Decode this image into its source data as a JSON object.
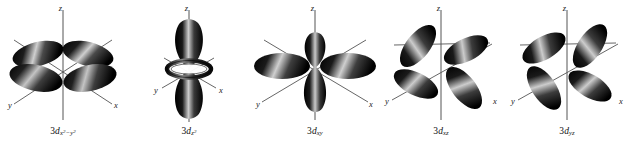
{
  "figure": {
    "background_color": "#ffffff",
    "lobe_color_dark": "#0b0b0b",
    "lobe_color_highlight": "#d8d8d8",
    "axis_color": "#555555",
    "text_color": "#111111"
  },
  "axis_labels": {
    "x": "x",
    "y": "y",
    "z": "z"
  },
  "orbitals": [
    {
      "id": "3d-x2-y2",
      "prefix": "3",
      "symbol": "d",
      "subscript_plain": "x2-y2",
      "caption_text": "3dx²−y²",
      "sub_first_var": "x",
      "sub_first_exp": "2",
      "sub_minus": "−",
      "sub_second_var": "y",
      "sub_second_exp": "2",
      "lobe_count": 4,
      "has_torus": false,
      "description": "four lobes along x and y axes"
    },
    {
      "id": "3d-z2",
      "prefix": "3",
      "symbol": "d",
      "subscript_plain": "z2",
      "caption_text": "3dz²",
      "sub_first_var": "z",
      "sub_first_exp": "2",
      "lobe_count": 2,
      "has_torus": true,
      "description": "two lobes along z with an equatorial torus"
    },
    {
      "id": "3d-xy",
      "prefix": "3",
      "symbol": "d",
      "subscript_plain": "xy",
      "caption_text": "3dxy",
      "sub_first_var": "x",
      "sub_second_var": "y",
      "lobe_count": 4,
      "has_torus": false,
      "description": "four lobes between x and y axes"
    },
    {
      "id": "3d-xz",
      "prefix": "3",
      "symbol": "d",
      "subscript_plain": "xz",
      "caption_text": "3dxz",
      "sub_first_var": "x",
      "sub_second_var": "z",
      "lobe_count": 4,
      "has_torus": false,
      "description": "four lobes between x and z axes"
    },
    {
      "id": "3d-yz",
      "prefix": "3",
      "symbol": "d",
      "subscript_plain": "yz",
      "caption_text": "3dyz",
      "sub_first_var": "y",
      "sub_second_var": "z",
      "lobe_count": 4,
      "has_torus": false,
      "description": "four lobes between y and z axes"
    }
  ]
}
